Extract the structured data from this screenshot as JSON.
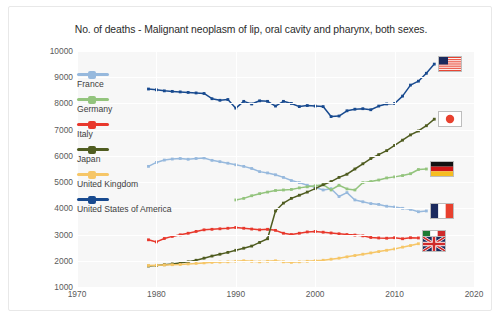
{
  "chart_data": {
    "type": "line",
    "title": "No. of deaths - Malignant neoplasm of lip, oral cavity and pharynx, both sexes.",
    "xlabel": "",
    "ylabel": "",
    "xlim": [
      1970,
      2020
    ],
    "ylim": [
      1000,
      10000
    ],
    "xticks": [
      1970,
      1980,
      1990,
      2000,
      2010,
      2020
    ],
    "yticks": [
      1000,
      2000,
      3000,
      4000,
      5000,
      6000,
      7000,
      8000,
      9000,
      10000
    ],
    "grid": true,
    "legend_position": "inside-left",
    "series": [
      {
        "name": "France",
        "color": "#97b9dd",
        "flag": "flag-france",
        "x": [
          1979,
          1980,
          1981,
          1982,
          1983,
          1984,
          1985,
          1986,
          1987,
          1988,
          1989,
          1990,
          1991,
          1992,
          1993,
          1994,
          1995,
          1996,
          1997,
          1998,
          1999,
          2000,
          2001,
          2002,
          2003,
          2004,
          2005,
          2006,
          2007,
          2008,
          2009,
          2010,
          2011,
          2012,
          2013,
          2014
        ],
        "y": [
          5600,
          5750,
          5840,
          5880,
          5900,
          5870,
          5900,
          5920,
          5830,
          5780,
          5720,
          5660,
          5600,
          5520,
          5400,
          5350,
          5280,
          5180,
          5060,
          4980,
          4880,
          4800,
          4700,
          4750,
          4450,
          4600,
          4320,
          4250,
          4180,
          4150,
          4080,
          4050,
          4000,
          3960,
          3870,
          3900
        ]
      },
      {
        "name": "Germany",
        "color": "#93c47d",
        "flag": "flag-germany",
        "x": [
          1990,
          1991,
          1992,
          1993,
          1994,
          1995,
          1996,
          1997,
          1998,
          1999,
          2000,
          2001,
          2002,
          2003,
          2004,
          2005,
          2006,
          2007,
          2008,
          2009,
          2010,
          2011,
          2012,
          2013,
          2014
        ],
        "y": [
          4320,
          4380,
          4480,
          4560,
          4620,
          4680,
          4700,
          4720,
          4780,
          4820,
          4860,
          4900,
          4700,
          4880,
          4740,
          4700,
          4980,
          5020,
          5080,
          5160,
          5200,
          5250,
          5320,
          5480,
          5500
        ]
      },
      {
        "name": "Italy",
        "color": "#e8382c",
        "flag": "flag-italy",
        "x": [
          1979,
          1980,
          1981,
          1982,
          1983,
          1984,
          1985,
          1986,
          1987,
          1988,
          1989,
          1990,
          1991,
          1992,
          1993,
          1994,
          1995,
          1996,
          1997,
          1998,
          1999,
          2000,
          2001,
          2002,
          2003,
          2004,
          2005,
          2006,
          2007,
          2008,
          2009,
          2010,
          2011,
          2012,
          2013
        ],
        "y": [
          2800,
          2720,
          2850,
          2930,
          2990,
          3050,
          3120,
          3180,
          3200,
          3220,
          3240,
          3270,
          3240,
          3210,
          3180,
          3200,
          3160,
          3050,
          3000,
          3050,
          3100,
          3120,
          3090,
          3060,
          3030,
          3000,
          2980,
          2950,
          2890,
          2870,
          2860,
          2880,
          2840,
          2880,
          2870
        ]
      },
      {
        "name": "Japan",
        "color": "#4f5c20",
        "flag": "flag-japan",
        "x": [
          1979,
          1980,
          1981,
          1982,
          1983,
          1984,
          1985,
          1986,
          1987,
          1988,
          1989,
          1990,
          1991,
          1992,
          1993,
          1994,
          1995,
          1996,
          1997,
          1998,
          1999,
          2000,
          2001,
          2002,
          2003,
          2004,
          2005,
          2006,
          2007,
          2008,
          2009,
          2010,
          2011,
          2012,
          2013,
          2014,
          2015
        ],
        "y": [
          1800,
          1820,
          1850,
          1880,
          1920,
          1960,
          2020,
          2100,
          2180,
          2250,
          2320,
          2400,
          2480,
          2560,
          2700,
          2840,
          3900,
          4200,
          4380,
          4500,
          4620,
          4750,
          4900,
          5020,
          5180,
          5300,
          5500,
          5700,
          5900,
          6050,
          6200,
          6400,
          6600,
          6800,
          6950,
          7150,
          7400
        ]
      },
      {
        "name": "United Kingdom",
        "color": "#f6c667",
        "flag": "flag-uk",
        "x": [
          1979,
          1980,
          1981,
          1982,
          1983,
          1984,
          1985,
          1986,
          1987,
          1988,
          1989,
          1990,
          1991,
          1992,
          1993,
          1994,
          1995,
          1996,
          1997,
          1998,
          1999,
          2000,
          2001,
          2002,
          2003,
          2004,
          2005,
          2006,
          2007,
          2008,
          2009,
          2010,
          2011,
          2012,
          2013
        ],
        "y": [
          1820,
          1830,
          1840,
          1850,
          1860,
          1880,
          1900,
          1920,
          1940,
          1950,
          1960,
          1980,
          2000,
          1980,
          1960,
          1980,
          2000,
          1960,
          1940,
          1960,
          1980,
          2000,
          2020,
          2060,
          2100,
          2150,
          2200,
          2250,
          2300,
          2350,
          2400,
          2450,
          2520,
          2580,
          2650
        ]
      },
      {
        "name": "United States of America",
        "color": "#184a8f",
        "flag": "flag-usa",
        "x": [
          1979,
          1980,
          1981,
          1982,
          1983,
          1984,
          1985,
          1986,
          1987,
          1988,
          1989,
          1990,
          1991,
          1992,
          1993,
          1994,
          1995,
          1996,
          1997,
          1998,
          1999,
          2000,
          2001,
          2002,
          2003,
          2004,
          2005,
          2006,
          2007,
          2008,
          2009,
          2010,
          2011,
          2012,
          2013,
          2014,
          2015
        ],
        "y": [
          8550,
          8520,
          8480,
          8460,
          8440,
          8420,
          8400,
          8380,
          8180,
          8120,
          8150,
          7820,
          8080,
          7980,
          8100,
          8080,
          7900,
          8080,
          8000,
          7880,
          7920,
          7900,
          7880,
          7500,
          7520,
          7720,
          7780,
          7800,
          7760,
          7900,
          7980,
          8000,
          8280,
          8700,
          8850,
          9150,
          9500
        ]
      }
    ]
  },
  "legend": {
    "items": [
      {
        "label": "France"
      },
      {
        "label": "Germany"
      },
      {
        "label": "Italy"
      },
      {
        "label": "Japan"
      },
      {
        "label": "United Kingdom"
      },
      {
        "label": "United States of America"
      }
    ]
  },
  "flags": {
    "usa": "flag-united-states-icon",
    "japan": "flag-japan-icon",
    "germany": "flag-germany-icon",
    "france": "flag-france-icon",
    "italy": "flag-italy-icon",
    "uk": "flag-united-kingdom-icon"
  }
}
